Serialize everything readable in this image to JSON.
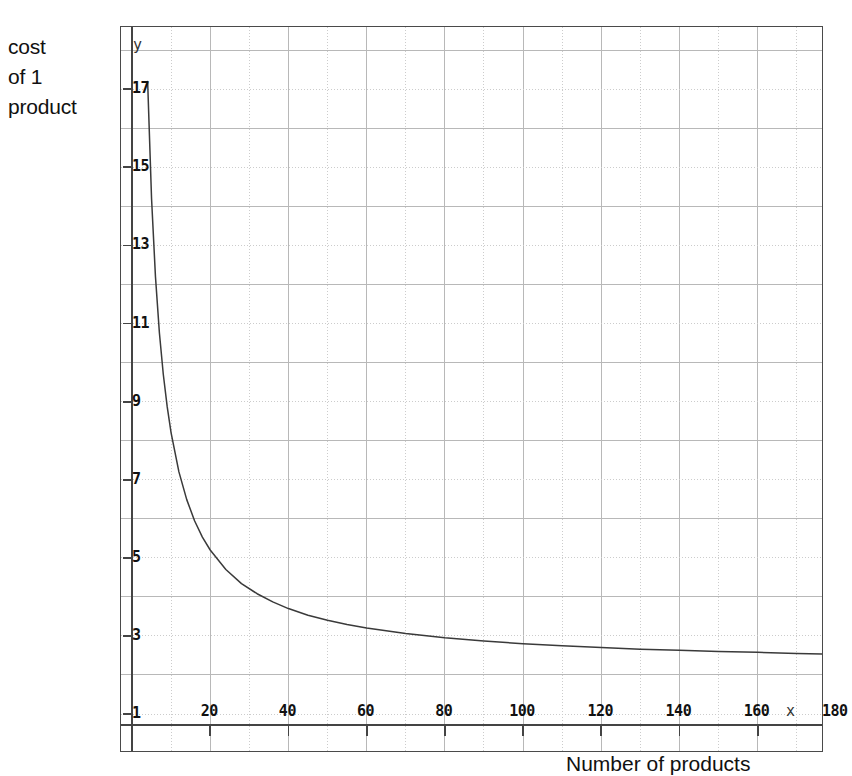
{
  "labels": {
    "y_caption_lines": [
      "cost",
      "of 1",
      "product"
    ],
    "x_caption": "Number of products",
    "y_axis_name": "y",
    "x_axis_name": "x"
  },
  "chart_data": {
    "type": "line",
    "title": "",
    "xlabel": "Number of products",
    "ylabel": "cost of 1 product",
    "xlim": [
      0,
      195
    ],
    "ylim": [
      0,
      18.7
    ],
    "grid": true,
    "legend": "none",
    "x_ticks": [
      20,
      40,
      60,
      80,
      100,
      120,
      140,
      160,
      180
    ],
    "y_ticks": [
      1,
      3,
      5,
      7,
      9,
      11,
      13,
      15,
      17
    ],
    "x_minor_step": 10,
    "y_minor_step": 1,
    "curve_description": "cost per unit decays hyperbolically toward an asymptote near 2.2",
    "x": [
      3,
      4,
      5,
      6,
      7,
      8,
      9,
      10,
      12,
      14,
      16,
      18,
      20,
      24,
      28,
      32,
      36,
      40,
      45,
      50,
      55,
      60,
      70,
      80,
      90,
      100,
      110,
      120,
      130,
      140,
      150,
      160,
      170,
      180,
      185
    ],
    "y": [
      22.2,
      17.2,
      14.2,
      12.2,
      10.77,
      9.7,
      8.87,
      8.2,
      7.2,
      6.49,
      5.95,
      5.53,
      5.2,
      4.7,
      4.34,
      4.08,
      3.87,
      3.7,
      3.53,
      3.4,
      3.29,
      3.2,
      3.06,
      2.95,
      2.87,
      2.8,
      2.75,
      2.7,
      2.66,
      2.63,
      2.6,
      2.58,
      2.55,
      2.53,
      2.52
    ],
    "asymptote": 2.2,
    "series": [
      {
        "name": "cost of 1 product",
        "color": "#3a3a3a"
      }
    ]
  },
  "colors": {
    "frame": "#4a4a4a",
    "axis": "#444444",
    "grid_major": "#b8b8b8",
    "grid_minor": "#cccccc",
    "curve": "#3a3a3a",
    "text": "#111111"
  }
}
